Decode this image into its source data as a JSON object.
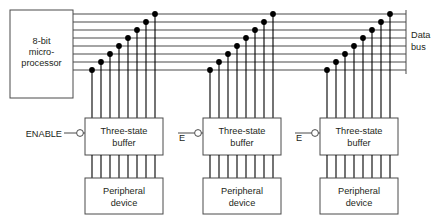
{
  "diagram": {
    "colors": {
      "background": "#ffffff",
      "line": "#4a4a4a",
      "drop_line": "#000000",
      "dot": "#000000",
      "text": "#231f20"
    },
    "bus": {
      "label_line1": "Data",
      "label_line2": "bus",
      "line_count": 8,
      "label_x": 411,
      "label_y1": 38,
      "label_y2": 50,
      "x_start": 73,
      "x_end": 406,
      "y_values": [
        14,
        22,
        30,
        38,
        46,
        54,
        62,
        70
      ],
      "end_tick_length": 4
    },
    "processor": {
      "label_line1": "8-bit",
      "label_line2": "micro-",
      "label_line3": "processor",
      "x": 10,
      "y": 10,
      "width": 63,
      "height": 88
    },
    "clusters": [
      {
        "id": "cluster-1",
        "buffer_label_line1": "Three-state",
        "buffer_label_line2": "buffer",
        "peripheral_label_line1": "Peripheral",
        "peripheral_label_line2": "device",
        "enable_label": "ENABLE",
        "enable_label_x": 62,
        "enable_label_y": 137,
        "enable_wire_x_start": 64,
        "buffer_x": 85,
        "buffer_y": 118,
        "buffer_width": 78,
        "buffer_height": 37,
        "peripheral_x": 85,
        "peripheral_y": 178,
        "peripheral_width": 78,
        "peripheral_height": 36,
        "drop_x_values": [
          92,
          101,
          110,
          119,
          128,
          137,
          146,
          155
        ],
        "tap_y_values": [
          70,
          62,
          54,
          46,
          38,
          30,
          22,
          14
        ],
        "bubble_cx": 80,
        "bubble_cy": 133,
        "bubble_r": 3.4
      },
      {
        "id": "cluster-2",
        "buffer_label_line1": "Three-state",
        "buffer_label_line2": "buffer",
        "peripheral_label_line1": "Peripheral",
        "peripheral_label_line2": "device",
        "enable_label": "E",
        "enable_label_x": 182,
        "enable_label_y": 141,
        "enable_wire_x_start": 178,
        "buffer_x": 203,
        "buffer_y": 118,
        "buffer_width": 78,
        "buffer_height": 37,
        "peripheral_x": 203,
        "peripheral_y": 178,
        "peripheral_width": 78,
        "peripheral_height": 36,
        "drop_x_values": [
          210,
          219,
          228,
          237,
          246,
          255,
          264,
          273
        ],
        "tap_y_values": [
          70,
          62,
          54,
          46,
          38,
          30,
          22,
          14
        ],
        "bubble_cx": 198,
        "bubble_cy": 133,
        "bubble_r": 3.4
      },
      {
        "id": "cluster-3",
        "buffer_label_line1": "Three-state",
        "buffer_label_line2": "buffer",
        "peripheral_label_line1": "Peripheral",
        "peripheral_label_line2": "device",
        "enable_label": "E",
        "enable_label_x": 299,
        "enable_label_y": 141,
        "enable_wire_x_start": 295,
        "buffer_x": 320,
        "buffer_y": 118,
        "buffer_width": 78,
        "buffer_height": 37,
        "peripheral_x": 320,
        "peripheral_y": 178,
        "peripheral_width": 78,
        "peripheral_height": 36,
        "drop_x_values": [
          327,
          336,
          345,
          354,
          363,
          372,
          381,
          390
        ],
        "tap_y_values": [
          70,
          62,
          54,
          46,
          38,
          30,
          22,
          14
        ],
        "bubble_cx": 315,
        "bubble_cy": 133,
        "bubble_r": 3.4
      }
    ]
  }
}
